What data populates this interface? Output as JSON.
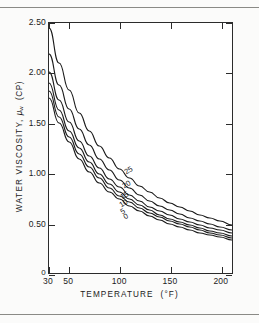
{
  "chart_data": {
    "type": "line",
    "title": "",
    "xlabel": "TEMPERATURE",
    "xunit": "(°F)",
    "ylabel": "WATER VISCOSITY,",
    "ysymbol": "μ",
    "ysubscript": "w",
    "yunit": "(CP)",
    "xlim": [
      30,
      212
    ],
    "ylim": [
      0,
      2.5
    ],
    "xticks": [
      30,
      50,
      100,
      150,
      200
    ],
    "xticklabels": [
      "30",
      "50",
      "100",
      "150",
      "200"
    ],
    "yticks": [
      0,
      0.5,
      1.0,
      1.5,
      2.0,
      2.5
    ],
    "yticklabels": [
      "0",
      "0.50",
      "1.00",
      "1.50",
      "2.00",
      "2.50"
    ],
    "grid": false,
    "legend_position": "inline-curve-labels",
    "series_label_note": "salinity percent",
    "x": [
      30,
      40,
      50,
      60,
      70,
      80,
      90,
      100,
      110,
      120,
      130,
      140,
      150,
      160,
      170,
      180,
      190,
      200,
      212
    ],
    "series": [
      {
        "name": "25",
        "label": "25",
        "values": [
          2.45,
          2.1,
          1.83,
          1.6,
          1.42,
          1.27,
          1.15,
          1.04,
          0.95,
          0.87,
          0.81,
          0.75,
          0.7,
          0.66,
          0.62,
          0.58,
          0.55,
          0.52,
          0.48
        ]
      },
      {
        "name": "20",
        "label": "20",
        "values": [
          2.19,
          1.88,
          1.64,
          1.44,
          1.28,
          1.14,
          1.03,
          0.93,
          0.85,
          0.78,
          0.72,
          0.67,
          0.63,
          0.59,
          0.55,
          0.52,
          0.49,
          0.46,
          0.43
        ]
      },
      {
        "name": "15",
        "label": "15",
        "values": [
          2.01,
          1.73,
          1.51,
          1.32,
          1.17,
          1.05,
          0.94,
          0.86,
          0.78,
          0.72,
          0.66,
          0.62,
          0.58,
          0.54,
          0.51,
          0.48,
          0.45,
          0.43,
          0.4
        ]
      },
      {
        "name": "10",
        "label": "10",
        "values": [
          1.9,
          1.63,
          1.42,
          1.25,
          1.11,
          0.99,
          0.89,
          0.81,
          0.74,
          0.68,
          0.63,
          0.58,
          0.54,
          0.51,
          0.48,
          0.45,
          0.42,
          0.4,
          0.37
        ]
      },
      {
        "name": "5",
        "label": "5",
        "values": [
          1.82,
          1.56,
          1.36,
          1.19,
          1.06,
          0.95,
          0.85,
          0.77,
          0.71,
          0.65,
          0.6,
          0.56,
          0.52,
          0.49,
          0.46,
          0.43,
          0.4,
          0.38,
          0.35
        ]
      },
      {
        "name": "0",
        "label": "0",
        "values": [
          1.75,
          1.5,
          1.31,
          1.14,
          1.01,
          0.9,
          0.81,
          0.74,
          0.67,
          0.62,
          0.57,
          0.53,
          0.49,
          0.46,
          0.43,
          0.4,
          0.38,
          0.36,
          0.33
        ]
      }
    ],
    "curve_label_positions": [
      {
        "label": "25",
        "x": 108,
        "y": 1.02
      },
      {
        "label": "20",
        "x": 106,
        "y": 0.88
      },
      {
        "label": "15",
        "x": 104,
        "y": 0.77
      },
      {
        "label": "10",
        "x": 103,
        "y": 0.69
      },
      {
        "label": "5",
        "x": 104,
        "y": 0.63
      },
      {
        "label": "0",
        "x": 107,
        "y": 0.58
      }
    ],
    "line_color": "#1a1a1a",
    "axis_color": "#2b2b2b",
    "background": "#ffffff"
  }
}
